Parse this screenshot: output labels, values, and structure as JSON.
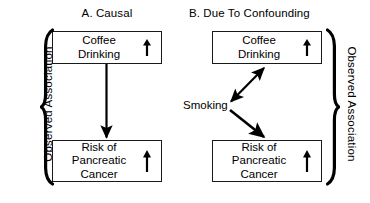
{
  "figure": {
    "width": 370,
    "height": 203,
    "background_color": "#ffffff",
    "ink_color": "#000000"
  },
  "panels": [
    {
      "id": "a",
      "title": "A. Causal",
      "nodes": [
        {
          "id": "a-top",
          "label": "Coffee\nDrinking",
          "trend_icon": "up-arrow-icon",
          "trend_symbol": "↑"
        },
        {
          "id": "a-bottom",
          "label": "Risk of\nPancreatic\nCancer",
          "trend_icon": "up-arrow-icon",
          "trend_symbol": "↑"
        }
      ],
      "connectors": [
        {
          "id": "a-causal-arrow",
          "name": "arrow-coffee-to-cancer",
          "style": "single-headed",
          "direction": "down"
        }
      ]
    },
    {
      "id": "b",
      "title": "B. Due To Confounding",
      "nodes": [
        {
          "id": "b-top",
          "label": "Coffee\nDrinking",
          "trend_icon": "up-arrow-icon",
          "trend_symbol": "↑"
        },
        {
          "id": "b-bottom",
          "label": "Risk of\nPancreatic\nCancer",
          "trend_icon": "up-arrow-icon",
          "trend_symbol": "↑"
        }
      ],
      "confounder": {
        "id": "b-confounder",
        "label": "Smoking"
      },
      "connectors": [
        {
          "id": "b-smoking-coffee-arrow",
          "name": "arrow-smoking-coffee-bidirectional",
          "style": "double-headed",
          "direction": "diagonal-up-right"
        },
        {
          "id": "b-smoking-cancer-arrow",
          "name": "arrow-smoking-to-cancer",
          "style": "single-headed",
          "direction": "diagonal-down-right"
        }
      ]
    }
  ],
  "braces": [
    {
      "id": "left",
      "glyph": "{",
      "caption": "Observed Association"
    },
    {
      "id": "right",
      "glyph": "}",
      "caption": "Observed Association"
    }
  ]
}
